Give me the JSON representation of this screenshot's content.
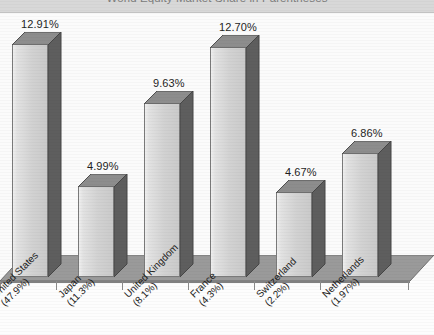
{
  "chart_data": {
    "type": "bar",
    "title": "World Equity Market Share in Parentheses",
    "xlabel": "",
    "ylabel": "",
    "ylim": [
      0,
      14
    ],
    "grid": false,
    "legend": "none",
    "style": "3d-bar",
    "categories": [
      "United States",
      "Japan",
      "United Kingdom",
      "France",
      "Switzerland",
      "Netherlands"
    ],
    "category_sublabels": [
      "(47.9%)",
      "(11.3%)",
      "(8.1%)",
      "(4.3%)",
      "(2.2%)",
      "(1.97%)"
    ],
    "values": [
      12.91,
      4.99,
      9.63,
      12.7,
      4.67,
      6.86
    ],
    "value_labels": [
      "12.91%",
      "4.99%",
      "9.63%",
      "12.70%",
      "4.67%",
      "6.86%"
    ]
  },
  "colors": {
    "bar_front": "#d2d2d2",
    "bar_side": "#5e5e5e",
    "bar_top": "#8d8d8d",
    "floor": "#9a9a9a",
    "title_band": "#d8d8d8",
    "background": "#fbfbfb",
    "text": "#1e1e1e"
  }
}
